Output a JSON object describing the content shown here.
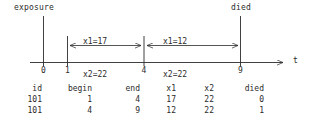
{
  "timeline": {
    "events": [
      {
        "name": "exposure",
        "label": "exposure",
        "t": 0
      },
      {
        "name": "died",
        "label": "died",
        "t": 9
      }
    ],
    "axis": {
      "name": "t",
      "ticks": [
        {
          "value": "0"
        },
        {
          "value": "1"
        },
        {
          "value": "4"
        },
        {
          "value": "9"
        }
      ]
    },
    "intervals": [
      {
        "from": "1",
        "to": "4",
        "x1_label": "x1=17",
        "x2_label": "x2=22"
      },
      {
        "from": "4",
        "to": "9",
        "x1_label": "x1=12",
        "x2_label": "x2=22"
      }
    ]
  },
  "table": {
    "headers": [
      "id",
      "begin",
      "end",
      "x1",
      "x2",
      "died"
    ],
    "rows": [
      [
        "101",
        "1",
        "4",
        "17",
        "22",
        "0"
      ],
      [
        "101",
        "4",
        "9",
        "12",
        "22",
        "1"
      ]
    ]
  },
  "colors": {
    "ink": "#2b2b2b",
    "background": "#ffffff"
  }
}
